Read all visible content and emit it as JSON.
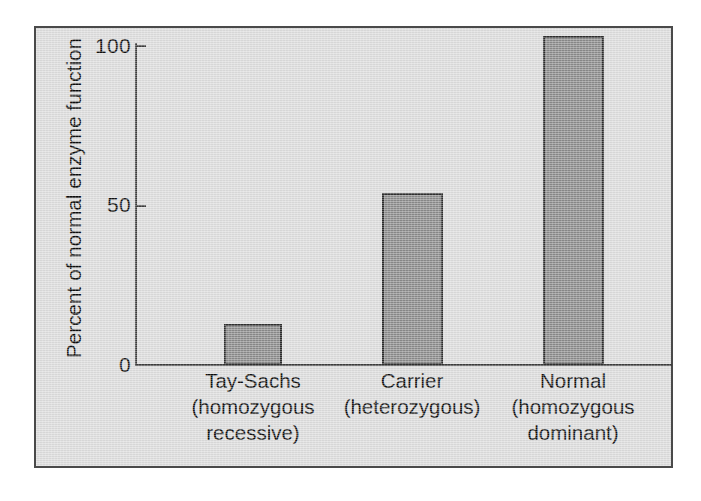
{
  "figure": {
    "background_color": "#dcdcdc",
    "frame_color": "#4a4a4a",
    "bar_fill_color": "#8a8a8a",
    "bar_border_color": "#2e2e2e",
    "axis_color": "#3c3c3c"
  },
  "chart_data": {
    "type": "bar",
    "title": "",
    "subtitle": "",
    "xlabel": "",
    "ylabel": "Percent of normal enzyme function",
    "ylim": [
      0,
      110
    ],
    "yticks": [
      0,
      50,
      100
    ],
    "ytick_labels": [
      "0",
      "50",
      "100"
    ],
    "grid": false,
    "legend": null,
    "categories": [
      "Tay-Sachs (homozygous recessive)",
      "Carrier (heterozygous)",
      "Normal (homozygous dominant)"
    ],
    "category_lines": [
      [
        "Tay-Sachs",
        "(homozygous",
        "recessive)"
      ],
      [
        "Carrier",
        "(heterozygous)"
      ],
      [
        "Normal",
        "(homozygous",
        "dominant)"
      ]
    ],
    "values": [
      13,
      54,
      103
    ],
    "annotations": []
  },
  "axis": {
    "tick_0": "0",
    "tick_50": "50",
    "tick_100": "100",
    "y_title": "Percent of normal enzyme function"
  },
  "labels": {
    "cat0_line0": "Tay-Sachs",
    "cat0_line1": "(homozygous",
    "cat0_line2": "recessive)",
    "cat1_line0": "Carrier",
    "cat1_line1": "(heterozygous)",
    "cat2_line0": "Normal",
    "cat2_line1": "(homozygous",
    "cat2_line2": "dominant)"
  }
}
